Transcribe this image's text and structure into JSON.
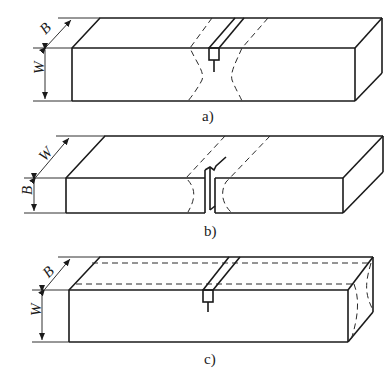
{
  "figure": {
    "panels": [
      {
        "id": "a",
        "caption": "a)",
        "dim_top": "B",
        "dim_side": "W",
        "notch": "top-face, through-thickness B"
      },
      {
        "id": "b",
        "caption": "b)",
        "dim_top": "W",
        "dim_side": "B",
        "notch": "side-face, through W"
      },
      {
        "id": "c",
        "caption": "c)",
        "dim_top": "B",
        "dim_side": "W",
        "notch": "top-face with side grooves"
      }
    ]
  },
  "colors": {
    "line": "#1a1a1a",
    "background": "#ffffff"
  }
}
